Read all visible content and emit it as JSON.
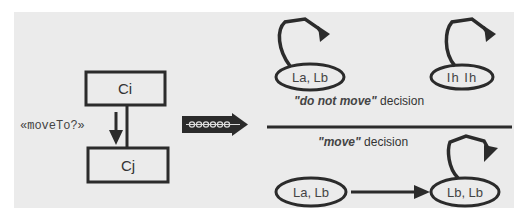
{
  "diagram": {
    "left": {
      "box_top": {
        "label": "Ci"
      },
      "box_bottom": {
        "label": "Cj"
      },
      "relation_label": "«moveTo?»"
    },
    "transition_arrow": {
      "pattern": "ooooo"
    },
    "do_not_move": {
      "caption_quoted": "\"do not move\"",
      "caption_rest": " decision",
      "states": [
        {
          "label": "La, Lb",
          "self_loop": true
        },
        {
          "label": "Ih Ih",
          "self_loop": true
        }
      ]
    },
    "move": {
      "caption_quoted": "\"move\"",
      "caption_rest": " decision",
      "states": [
        {
          "label": "La, Lb",
          "self_loop": false
        },
        {
          "label": "Lb, Lb",
          "self_loop": true
        }
      ]
    }
  },
  "colors": {
    "panel": "#ebebeb",
    "stroke": "#2b2b2b"
  }
}
